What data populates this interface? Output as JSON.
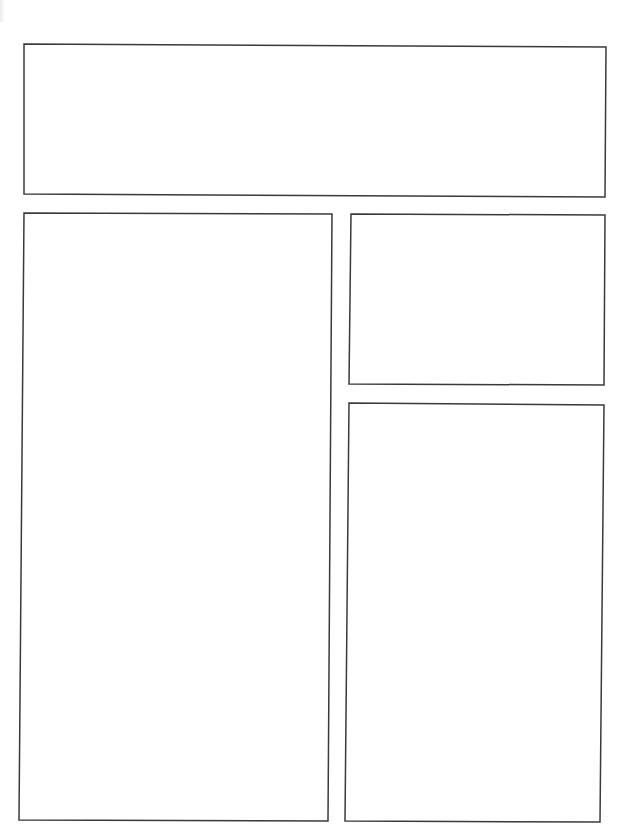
{
  "page": {
    "type": "comic-panel-template",
    "background_color": "#ffffff",
    "border_color": "#3a3a3a"
  },
  "panels": [
    {
      "id": "panel-1",
      "label": "",
      "position": "top-wide"
    },
    {
      "id": "panel-2",
      "label": "",
      "position": "left-tall"
    },
    {
      "id": "panel-3",
      "label": "",
      "position": "right-upper"
    },
    {
      "id": "panel-4",
      "label": "",
      "position": "right-lower"
    }
  ]
}
